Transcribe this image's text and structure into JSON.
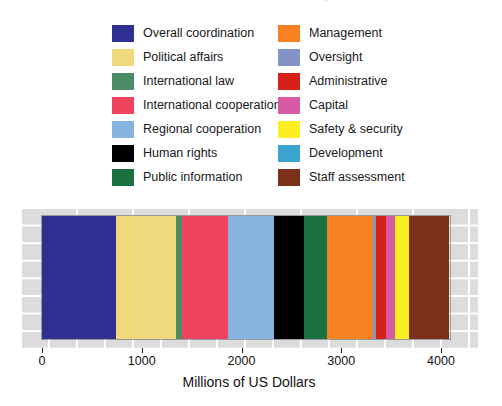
{
  "header": {
    "running_head": "UN SYSTEM BUDGET FOR THE BIENNIUM, MILLIONS"
  },
  "legend": {
    "left_column": [
      {
        "label": "Overall coordination",
        "color": "#2e3192"
      },
      {
        "label": "Political affairs",
        "color": "#efd97a"
      },
      {
        "label": "International law",
        "color": "#4b8c67"
      },
      {
        "label": "International cooperation",
        "color": "#ef4360"
      },
      {
        "label": "Regional cooperation",
        "color": "#86b3e0"
      },
      {
        "label": "Human rights",
        "color": "#000000"
      },
      {
        "label": "Public information",
        "color": "#18713f"
      }
    ],
    "right_column": [
      {
        "label": "Management",
        "color": "#f5821f"
      },
      {
        "label": "Oversight",
        "color": "#8393c8"
      },
      {
        "label": "Administrative",
        "color": "#d62118"
      },
      {
        "label": "Capital",
        "color": "#d65ba4"
      },
      {
        "label": "Safety & security",
        "color": "#fbee23"
      },
      {
        "label": "Development",
        "color": "#3ba4cf"
      },
      {
        "label": "Staff assessment",
        "color": "#7b3019"
      }
    ]
  },
  "chart_data": {
    "type": "bar",
    "orientation": "horizontal-stacked",
    "title": "",
    "xlabel": "Millions of US Dollars",
    "ylabel": "",
    "xlim": [
      0,
      4090
    ],
    "xticks": [
      0,
      1000,
      2000,
      3000,
      4000
    ],
    "xtick_labels": [
      "0",
      "1000",
      "2000",
      "3000",
      "4000"
    ],
    "grid": false,
    "legend_position": "above-plot",
    "categories": [
      "Overall coordination",
      "Political affairs",
      "International law",
      "International cooperation",
      "Regional cooperation",
      "Human rights",
      "Public information",
      "Management",
      "Oversight",
      "Administrative",
      "Capital",
      "Safety & security",
      "Development",
      "Staff assessment"
    ],
    "values": [
      740,
      600,
      60,
      460,
      470,
      300,
      230,
      460,
      30,
      100,
      90,
      140,
      0,
      400
    ],
    "colors": [
      "#2e3192",
      "#efd97a",
      "#4b8c67",
      "#ef4360",
      "#86b3e0",
      "#000000",
      "#18713f",
      "#f5821f",
      "#8393c8",
      "#d62118",
      "#d65ba4",
      "#fbee23",
      "#3ba4cf",
      "#7b3019"
    ],
    "total": 4080
  }
}
